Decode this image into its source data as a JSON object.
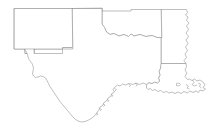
{
  "figure": {
    "kind": "choropleth-map",
    "title": "",
    "background_color": "#ffffff",
    "width": 214,
    "height": 136
  },
  "style": {
    "outline_color": "#8a8a8a",
    "outline_width": 0.55,
    "highlight_fill": "#808080",
    "highlight_stroke": "#9a9a9a",
    "state_fill": "#ffffff"
  },
  "states": [
    {
      "id": "new-mexico",
      "name": "New Mexico",
      "fill": "#ffffff",
      "highlighted": true
    },
    {
      "id": "texas",
      "name": "Texas",
      "fill": "#ffffff",
      "highlighted": false
    },
    {
      "id": "oklahoma",
      "name": "Oklahoma",
      "fill": "#ffffff",
      "highlighted": false
    },
    {
      "id": "arkansas",
      "name": "Arkansas",
      "fill": "#ffffff",
      "highlighted": false
    },
    {
      "id": "louisiana",
      "name": "Louisiana",
      "fill": "#ffffff",
      "highlighted": false
    }
  ],
  "highlighted_regions": [
    {
      "id": "region-north-block",
      "label": "",
      "fill": "#707070"
    },
    {
      "id": "region-central-block",
      "label": "",
      "fill": "#808080"
    },
    {
      "id": "region-west-block",
      "label": "",
      "fill": "#8c8c8c"
    },
    {
      "id": "region-east-strip",
      "label": "",
      "fill": "#8a8a8a"
    },
    {
      "id": "region-southwest-block",
      "label": "",
      "fill": "#888888"
    }
  ],
  "legend": {
    "visible": false,
    "entries": []
  },
  "labels": {
    "visible": false,
    "items": []
  }
}
